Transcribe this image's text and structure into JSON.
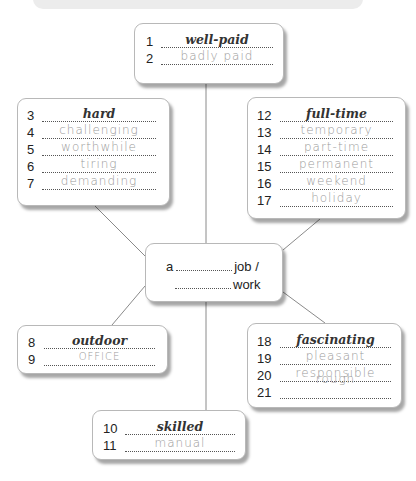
{
  "diagram": {
    "center": {
      "prefix": "a",
      "line1_suffix": "job /",
      "line2_suffix": "work"
    },
    "boxes": [
      {
        "id": "top",
        "rows": [
          {
            "num": "1",
            "answer": "well-paid",
            "type": "given"
          },
          {
            "num": "2",
            "answer": "badly paid",
            "type": "handwritten"
          }
        ]
      },
      {
        "id": "upper-left",
        "rows": [
          {
            "num": "3",
            "answer": "hard",
            "type": "given"
          },
          {
            "num": "4",
            "answer": "challenging",
            "type": "handwritten"
          },
          {
            "num": "5",
            "answer": "worthwhile",
            "type": "handwritten"
          },
          {
            "num": "6",
            "answer": "tiring",
            "type": "handwritten"
          },
          {
            "num": "7",
            "answer": "demanding",
            "type": "handwritten"
          }
        ]
      },
      {
        "id": "upper-right",
        "rows": [
          {
            "num": "12",
            "answer": "full-time",
            "type": "given"
          },
          {
            "num": "13",
            "answer": "temporary",
            "type": "handwritten"
          },
          {
            "num": "14",
            "answer": "part-time",
            "type": "handwritten"
          },
          {
            "num": "15",
            "answer": "permanent",
            "type": "handwritten"
          },
          {
            "num": "16",
            "answer": "weekend",
            "type": "handwritten"
          },
          {
            "num": "17",
            "answer": "holiday",
            "type": "handwritten"
          }
        ]
      },
      {
        "id": "lower-left",
        "rows": [
          {
            "num": "8",
            "answer": "outdoor",
            "type": "given"
          },
          {
            "num": "9",
            "answer": "office",
            "type": "handwritten"
          }
        ]
      },
      {
        "id": "lower-right",
        "rows": [
          {
            "num": "18",
            "answer": "fascinating",
            "type": "given"
          },
          {
            "num": "19",
            "answer": "pleasant",
            "type": "handwritten"
          },
          {
            "num": "20",
            "answer": "responsible",
            "type": "handwritten"
          },
          {
            "num": "21",
            "answer": "rough",
            "type": "handwritten"
          }
        ]
      },
      {
        "id": "bottom",
        "rows": [
          {
            "num": "10",
            "answer": "skilled",
            "type": "given"
          },
          {
            "num": "11",
            "answer": "manual",
            "type": "handwritten"
          }
        ]
      }
    ]
  }
}
